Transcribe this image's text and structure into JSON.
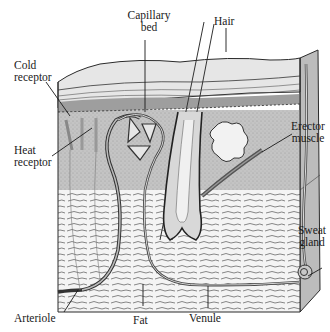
{
  "figure": {
    "colors": {
      "background": "#ffffff",
      "line": "#2a2a2a",
      "epidermis": "#cfcfcf",
      "dermis": "#bdbdbd",
      "fat": "#f2f2f2",
      "label": "#1a1a1a"
    }
  },
  "labels": {
    "capillary_bed": {
      "line1": "Capillary",
      "line2": "bed"
    },
    "hair": {
      "line1": "Hair"
    },
    "cold_receptor": {
      "line1": "Cold",
      "line2": "receptor"
    },
    "heat_receptor": {
      "line1": "Heat",
      "line2": "receptor"
    },
    "erector_muscle": {
      "line1": "Erector",
      "line2": "muscle"
    },
    "sweat_gland": {
      "line1": "Sweat",
      "line2": "gland"
    },
    "arteriole": {
      "line1": "Arteriole"
    },
    "fat": {
      "line1": "Fat"
    },
    "venule": {
      "line1": "Venule"
    }
  }
}
